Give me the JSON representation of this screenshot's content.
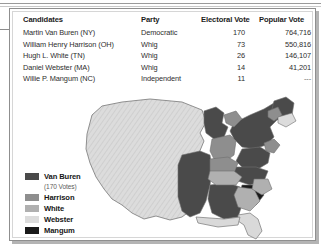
{
  "table": {
    "headers": [
      "Candidates",
      "Party",
      "Electoral Vote",
      "Popular Vote"
    ],
    "rows": [
      {
        "candidate": "Martin Van Buren (NY)",
        "party": "Democratic",
        "electoral": "170",
        "popular": "764,716"
      },
      {
        "candidate": "William Henry Harrison (OH)",
        "party": "Whig",
        "electoral": "73",
        "popular": "550,816"
      },
      {
        "candidate": "Hugh L. White (TN)",
        "party": "Whig",
        "electoral": "26",
        "popular": "146,107"
      },
      {
        "candidate": "Daniel Webster (MA)",
        "party": "Whig",
        "electoral": "14",
        "popular": "41,201"
      },
      {
        "candidate": "Willie P. Mangum (NC)",
        "party": "Independent",
        "electoral": "11",
        "popular": "---"
      }
    ]
  },
  "legend": {
    "items": [
      {
        "label": "Van Buren",
        "sublabel": "(170 Votes)",
        "color": "#4a4a4a"
      },
      {
        "label": "Harrison",
        "sublabel": "",
        "color": "#8e8e8e"
      },
      {
        "label": "White",
        "sublabel": "",
        "color": "#b0b0b0"
      },
      {
        "label": "Webster",
        "sublabel": "",
        "color": "#dcdcdc"
      },
      {
        "label": "Mangum",
        "sublabel": "",
        "color": "#1a1a1a"
      }
    ]
  },
  "map": {
    "name": "united-states-electoral-map-1836",
    "territory_fill": "#d9d9d9",
    "territory_hatch": "#bdbdbd",
    "outline": "#6f6f6f",
    "colors": {
      "van_buren": "#4a4a4a",
      "harrison": "#8e8e8e",
      "white": "#b0b0b0",
      "webster": "#dcdcdc",
      "mangum": "#1a1a1a",
      "territory": "#d9d9d9"
    }
  }
}
